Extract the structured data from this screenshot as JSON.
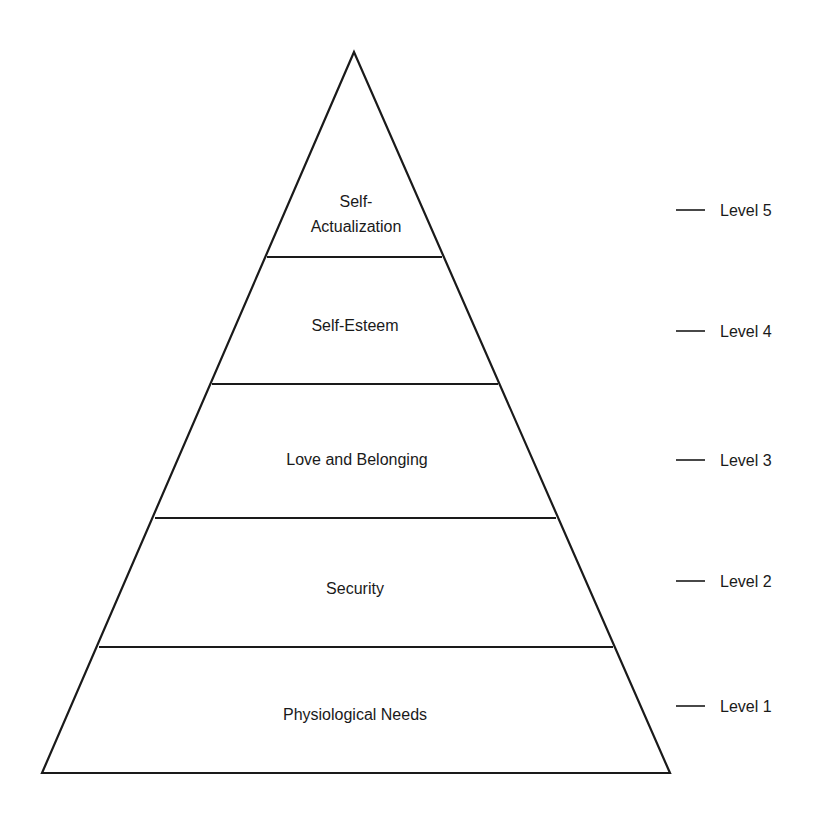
{
  "diagram": {
    "type": "pyramid",
    "line_color": "#1a1a1a",
    "background": "#ffffff",
    "tiers": [
      {
        "label_lines": [
          "Self-",
          "Actualization"
        ],
        "level": "Level 5"
      },
      {
        "label_lines": [
          "Self-Esteem"
        ],
        "level": "Level 4"
      },
      {
        "label_lines": [
          "Love and Belonging"
        ],
        "level": "Level 3"
      },
      {
        "label_lines": [
          "Security"
        ],
        "level": "Level 2"
      },
      {
        "label_lines": [
          "Physiological Needs"
        ],
        "level": "Level 1"
      }
    ]
  }
}
